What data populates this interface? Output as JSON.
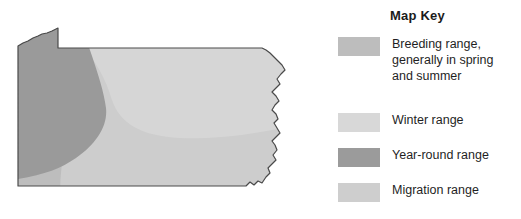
{
  "map": {
    "region_name": "Pennsylvania",
    "outline_color": "#4a4a4a",
    "regions": [
      {
        "name": "year-round-region",
        "color": "#9a9a9a"
      },
      {
        "name": "breeding-region",
        "color": "#bdbdbd"
      },
      {
        "name": "winter-region",
        "color": "#d6d6d6"
      },
      {
        "name": "migration-region",
        "color": "#cdcdcd"
      }
    ]
  },
  "legend": {
    "title": "Map Key",
    "entries": [
      {
        "name": "breeding",
        "color": "#bdbdbd",
        "lines": [
          "Breeding range,",
          "generally in spring",
          "and summer"
        ]
      },
      {
        "name": "winter",
        "color": "#d8d8d8",
        "lines": [
          "Winter range"
        ]
      },
      {
        "name": "year-round",
        "color": "#9b9b9b",
        "lines": [
          "Year-round range"
        ]
      },
      {
        "name": "migration",
        "color": "#cecece",
        "lines": [
          "Migration range"
        ]
      }
    ]
  }
}
